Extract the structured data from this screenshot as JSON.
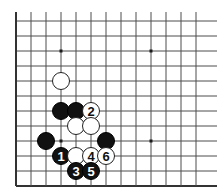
{
  "figure": {
    "kind": "go-board-diagram",
    "title": "",
    "background_color": "#ffffff"
  },
  "board": {
    "line_color": "#4d4d4d",
    "edge_color": "#333333",
    "line_width": 1,
    "edge_width": 2,
    "cell_size": 15,
    "origin_x": 16,
    "origin_y": 21,
    "columns": 13,
    "rows": 12,
    "vertical_line_x": [
      16,
      31,
      46,
      61,
      76,
      91,
      106,
      121,
      136,
      151,
      166,
      181,
      196
    ],
    "horizontal_line_y": [
      21,
      36,
      51,
      66,
      81,
      96,
      111,
      126,
      141,
      156,
      171,
      186
    ],
    "star_points": [
      {
        "name": "star-point-upper-left",
        "x": 61,
        "y": 51
      },
      {
        "name": "star-point-upper-right",
        "x": 151,
        "y": 51
      },
      {
        "name": "star-point-lower-left",
        "x": 61,
        "y": 141
      },
      {
        "name": "star-point-lower-right",
        "x": 151,
        "y": 141
      }
    ],
    "star_point_size": 3,
    "star_point_color": "#1a1a1a"
  },
  "stones": {
    "radius": 8.5,
    "black_fill": "#111111",
    "black_stroke": "#000000",
    "white_fill": "#ffffff",
    "white_stroke": "#222222",
    "black_label_color": "#ffffff",
    "white_label_color": "#111111",
    "items": [
      {
        "name": "white-stone-a",
        "color": "white",
        "x": 61,
        "y": 81,
        "label": ""
      },
      {
        "name": "black-stone-b",
        "color": "black",
        "x": 61,
        "y": 111,
        "label": ""
      },
      {
        "name": "black-stone-c",
        "color": "black",
        "x": 76,
        "y": 111,
        "label": ""
      },
      {
        "name": "white-stone-move-2",
        "color": "white",
        "x": 91,
        "y": 111,
        "label": "2"
      },
      {
        "name": "white-stone-d",
        "color": "white",
        "x": 76,
        "y": 126,
        "label": ""
      },
      {
        "name": "white-stone-e",
        "color": "white",
        "x": 91,
        "y": 126,
        "label": ""
      },
      {
        "name": "black-stone-f",
        "color": "black",
        "x": 46,
        "y": 141,
        "label": ""
      },
      {
        "name": "black-stone-g",
        "color": "black",
        "x": 106,
        "y": 141,
        "label": ""
      },
      {
        "name": "black-stone-move-1",
        "color": "black",
        "x": 61,
        "y": 156,
        "label": "1"
      },
      {
        "name": "white-stone-h",
        "color": "white",
        "x": 76,
        "y": 156,
        "label": ""
      },
      {
        "name": "white-stone-move-4",
        "color": "white",
        "x": 91,
        "y": 156,
        "label": "4"
      },
      {
        "name": "white-stone-move-6",
        "color": "white",
        "x": 106,
        "y": 156,
        "label": "6"
      },
      {
        "name": "black-stone-move-3",
        "color": "black",
        "x": 76,
        "y": 171,
        "label": "3"
      },
      {
        "name": "black-stone-move-5",
        "color": "black",
        "x": 91,
        "y": 171,
        "label": "5"
      }
    ]
  },
  "move_sequence": [
    {
      "number": "1",
      "color": "black"
    },
    {
      "number": "2",
      "color": "white"
    },
    {
      "number": "3",
      "color": "black"
    },
    {
      "number": "4",
      "color": "white"
    },
    {
      "number": "5",
      "color": "black"
    },
    {
      "number": "6",
      "color": "white"
    }
  ]
}
